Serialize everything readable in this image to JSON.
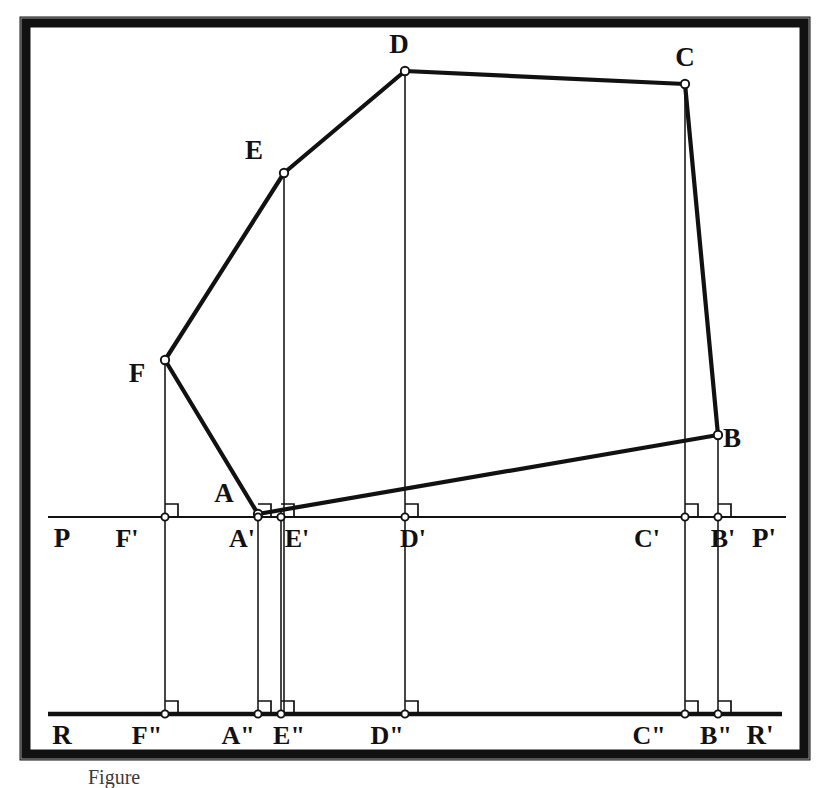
{
  "figure": {
    "caption": "Figure",
    "background_color": "#ffffff",
    "ink_color": "#111111",
    "frame": {
      "outer_color": "#111111",
      "inner_color": "#ffffff",
      "x": 25,
      "y": 22,
      "width": 780,
      "height": 733,
      "border_thickness": 11
    },
    "ground_lines": [
      {
        "name": "P-P'",
        "left_label": "P",
        "right_label": "P'",
        "y": 517,
        "x1": 48,
        "x2": 786
      },
      {
        "name": "R-R'",
        "left_label": "R",
        "right_label": "R'",
        "y": 714,
        "x1": 48,
        "x2": 782
      }
    ],
    "vertices": [
      {
        "id": "A",
        "label": "A",
        "x": 258,
        "y": 514,
        "label_dx": -34,
        "label_dy": -12
      },
      {
        "id": "B",
        "label": "B",
        "x": 718,
        "y": 435,
        "label_dx": 14,
        "label_dy": 12
      },
      {
        "id": "C",
        "label": "C",
        "x": 685,
        "y": 84,
        "label_dx": 0,
        "label_dy": -18
      },
      {
        "id": "D",
        "label": "D",
        "x": 405,
        "y": 71,
        "label_dx": -6,
        "label_dy": -18
      },
      {
        "id": "E",
        "label": "E",
        "x": 284,
        "y": 173,
        "label_dx": -30,
        "label_dy": -14
      },
      {
        "id": "F",
        "label": "F",
        "x": 165,
        "y": 360,
        "label_dx": -28,
        "label_dy": 22
      }
    ],
    "polygon_order": [
      "A",
      "F",
      "E",
      "D",
      "C",
      "B"
    ],
    "first_projection": [
      {
        "id": "A1",
        "label": "A'",
        "x": 258,
        "y": 517,
        "label_dx": -16,
        "label_dy": 30
      },
      {
        "id": "B1",
        "label": "B'",
        "x": 718,
        "y": 517,
        "label_dx": 5,
        "label_dy": 30
      },
      {
        "id": "C1",
        "label": "C'",
        "x": 685,
        "y": 517,
        "label_dx": -38,
        "label_dy": 30
      },
      {
        "id": "D1",
        "label": "D'",
        "x": 405,
        "y": 517,
        "label_dx": 8,
        "label_dy": 30
      },
      {
        "id": "E1",
        "label": "E'",
        "x": 281,
        "y": 517,
        "label_dx": 16,
        "label_dy": 30
      },
      {
        "id": "F1",
        "label": "F'",
        "x": 165,
        "y": 517,
        "label_dx": -38,
        "label_dy": 30
      }
    ],
    "second_projection": [
      {
        "id": "A2",
        "label": "A\"",
        "x": 258,
        "y": 714,
        "label_dx": -20,
        "label_dy": 30
      },
      {
        "id": "B2",
        "label": "B\"",
        "x": 718,
        "y": 714,
        "label_dx": -2,
        "label_dy": 30
      },
      {
        "id": "C2",
        "label": "C\"",
        "x": 685,
        "y": 714,
        "label_dx": -36,
        "label_dy": 30
      },
      {
        "id": "D2",
        "label": "D\"",
        "x": 405,
        "y": 714,
        "label_dx": -18,
        "label_dy": 30
      },
      {
        "id": "E2",
        "label": "E\"",
        "x": 281,
        "y": 714,
        "label_dx": 8,
        "label_dy": 30
      },
      {
        "id": "F2",
        "label": "F\"",
        "x": 165,
        "y": 714,
        "label_dx": -18,
        "label_dy": 30
      }
    ],
    "end_labels": {
      "p_left": "P",
      "p_right": "P'",
      "r_left": "R",
      "r_right": "R'"
    },
    "notes": {
      "right_angle_marks": "square marks at every foot of perpendicular on both ground lines",
      "projector_direction": "vertical, downward from each vertex through P-P' to R-R'"
    }
  }
}
